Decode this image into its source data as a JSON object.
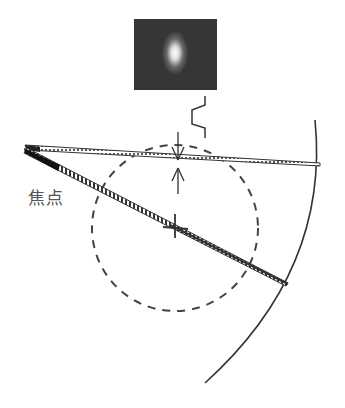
{
  "diagram": {
    "focus_label": "焦点",
    "elements": [
      {
        "name": "spot-image",
        "desc": "dark square with bright elliptical spot"
      },
      {
        "name": "step-line",
        "desc": "step-shaped profile symbol"
      },
      {
        "name": "upper-beam",
        "desc": "dotted triangular beam from focus to outer arc"
      },
      {
        "name": "lower-beam",
        "desc": "narrow striped beam from focus to outer arc"
      },
      {
        "name": "dashed-circle",
        "desc": "dashed circle"
      },
      {
        "name": "outer-arc",
        "desc": "large arc on right"
      },
      {
        "name": "width-arrows",
        "desc": "opposing arrows marking beam width"
      },
      {
        "name": "cross-mark",
        "desc": "cross on lower beam"
      }
    ],
    "colors": {
      "line": "#333333",
      "spot_bg": "#3a3a3a",
      "spot": "#ffffff"
    }
  }
}
